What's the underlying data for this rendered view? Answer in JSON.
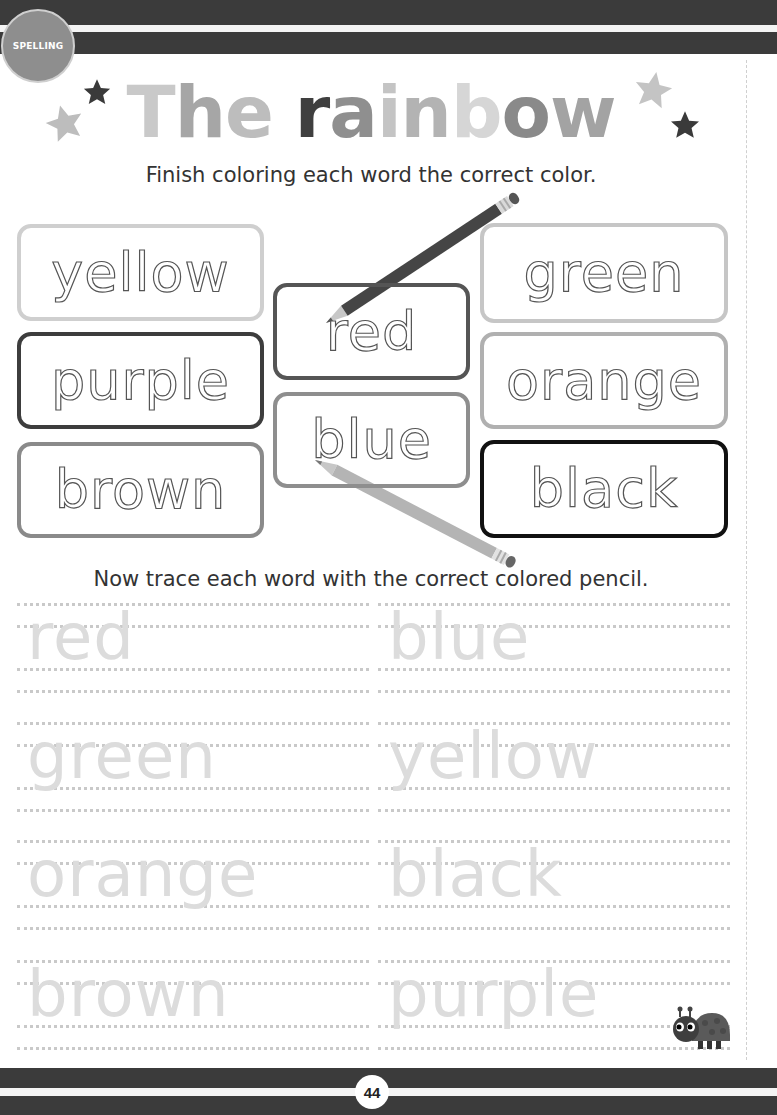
{
  "header": {
    "section_label": "SPELLING"
  },
  "title": {
    "letters": [
      {
        "ch": "T",
        "color": "#c9c9c9"
      },
      {
        "ch": "h",
        "color": "#a6a6a6"
      },
      {
        "ch": "e",
        "color": "#bdbdbd"
      },
      {
        "ch": " ",
        "color": "#ffffff"
      },
      {
        "ch": "r",
        "color": "#3f3f3f"
      },
      {
        "ch": "a",
        "color": "#8f8f8f"
      },
      {
        "ch": "i",
        "color": "#c4c4c4"
      },
      {
        "ch": "n",
        "color": "#b3b3b3"
      },
      {
        "ch": "b",
        "color": "#d6d6d6"
      },
      {
        "ch": "o",
        "color": "#8a8a8a"
      },
      {
        "ch": "w",
        "color": "#a3a3a3"
      }
    ],
    "text": "The rainbow"
  },
  "instructions": {
    "coloring": "Finish coloring each word the correct color.",
    "tracing": "Now trace each word with the correct colored pencil."
  },
  "color_words": [
    {
      "word": "yellow",
      "border": "#cfcfcf"
    },
    {
      "word": "purple",
      "border": "#3d3d3d"
    },
    {
      "word": "brown",
      "border": "#8a8a8a"
    },
    {
      "word": "red",
      "border": "#555555"
    },
    {
      "word": "blue",
      "border": "#8e8e8e"
    },
    {
      "word": "green",
      "border": "#c6c6c6"
    },
    {
      "word": "orange",
      "border": "#b0b0b0"
    },
    {
      "word": "black",
      "border": "#111111"
    }
  ],
  "trace_words": {
    "left": [
      "red",
      "green",
      "orange",
      "brown"
    ],
    "right": [
      "blue",
      "yellow",
      "black",
      "purple"
    ]
  },
  "footer": {
    "page_number": "44"
  },
  "icons": {
    "stars": "star-icon",
    "pencils": "pencil-icon",
    "mascot": "ladybug-icon"
  }
}
